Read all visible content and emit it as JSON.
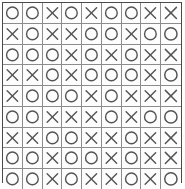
{
  "figure": {
    "type": "symbol-grid",
    "rows": 9,
    "columns": 9,
    "symbols": {
      "O": "circle-icon",
      "X": "cross-icon"
    },
    "colors": {
      "background": "#ffffff",
      "cell_background": "#fdfdfd",
      "outer_border": "#4a4a4a",
      "cell_border": "#8c8c8c",
      "symbol_stroke": "#555555"
    },
    "grid": [
      [
        "O",
        "O",
        "X",
        "O",
        "X",
        "O",
        "O",
        "X",
        "X"
      ],
      [
        "X",
        "O",
        "X",
        "X",
        "O",
        "O",
        "X",
        "O",
        "O"
      ],
      [
        "O",
        "O",
        "O",
        "X",
        "O",
        "X",
        "O",
        "X",
        "X"
      ],
      [
        "X",
        "X",
        "O",
        "X",
        "O",
        "O",
        "O",
        "X",
        "O"
      ],
      [
        "X",
        "O",
        "O",
        "O",
        "X",
        "O",
        "X",
        "X",
        "X"
      ],
      [
        "O",
        "O",
        "X",
        "X",
        "X",
        "O",
        "X",
        "O",
        "O"
      ],
      [
        "X",
        "X",
        "O",
        "O",
        "X",
        "X",
        "O",
        "X",
        "X"
      ],
      [
        "O",
        "O",
        "X",
        "O",
        "O",
        "X",
        "O",
        "X",
        "X"
      ],
      [
        "O",
        "O",
        "X",
        "O",
        "X",
        "X",
        "O",
        "X",
        "O"
      ]
    ]
  }
}
